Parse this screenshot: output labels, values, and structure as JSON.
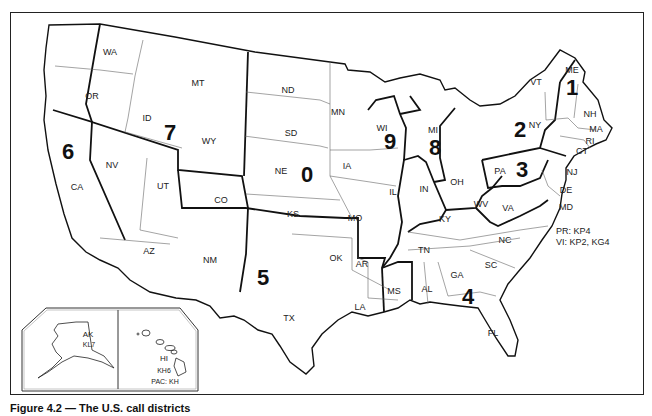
{
  "figure": {
    "caption": "Figure 4.2 — The U.S. call districts",
    "type": "map"
  },
  "districts": [
    {
      "id": "0",
      "label": "0",
      "x": 307,
      "y": 175
    },
    {
      "id": "1",
      "label": "1",
      "x": 572,
      "y": 88
    },
    {
      "id": "2",
      "label": "2",
      "x": 520,
      "y": 130
    },
    {
      "id": "3",
      "label": "3",
      "x": 522,
      "y": 170
    },
    {
      "id": "4",
      "label": "4",
      "x": 468,
      "y": 297
    },
    {
      "id": "5",
      "label": "5",
      "x": 263,
      "y": 278
    },
    {
      "id": "6",
      "label": "6",
      "x": 68,
      "y": 152
    },
    {
      "id": "7",
      "label": "7",
      "x": 170,
      "y": 133
    },
    {
      "id": "8",
      "label": "8",
      "x": 435,
      "y": 148
    },
    {
      "id": "9",
      "label": "9",
      "x": 390,
      "y": 142
    }
  ],
  "states": [
    {
      "abbr": "WA",
      "x": 110,
      "y": 52
    },
    {
      "abbr": "OR",
      "x": 92,
      "y": 96
    },
    {
      "abbr": "CA",
      "x": 77,
      "y": 187
    },
    {
      "abbr": "NV",
      "x": 112,
      "y": 165
    },
    {
      "abbr": "ID",
      "x": 147,
      "y": 118
    },
    {
      "abbr": "MT",
      "x": 198,
      "y": 83
    },
    {
      "abbr": "WY",
      "x": 209,
      "y": 141
    },
    {
      "abbr": "UT",
      "x": 163,
      "y": 186
    },
    {
      "abbr": "CO",
      "x": 221,
      "y": 200
    },
    {
      "abbr": "AZ",
      "x": 149,
      "y": 251
    },
    {
      "abbr": "NM",
      "x": 210,
      "y": 260
    },
    {
      "abbr": "ND",
      "x": 288,
      "y": 90
    },
    {
      "abbr": "SD",
      "x": 291,
      "y": 133
    },
    {
      "abbr": "NE",
      "x": 281,
      "y": 171
    },
    {
      "abbr": "KS",
      "x": 293,
      "y": 214
    },
    {
      "abbr": "OK",
      "x": 336,
      "y": 258
    },
    {
      "abbr": "TX",
      "x": 289,
      "y": 318
    },
    {
      "abbr": "MN",
      "x": 338,
      "y": 112
    },
    {
      "abbr": "IA",
      "x": 347,
      "y": 166
    },
    {
      "abbr": "MO",
      "x": 355,
      "y": 218
    },
    {
      "abbr": "AR",
      "x": 362,
      "y": 264
    },
    {
      "abbr": "LA",
      "x": 360,
      "y": 307
    },
    {
      "abbr": "WI",
      "x": 382,
      "y": 128
    },
    {
      "abbr": "IL",
      "x": 393,
      "y": 192
    },
    {
      "abbr": "MI",
      "x": 433,
      "y": 130
    },
    {
      "abbr": "IN",
      "x": 424,
      "y": 189
    },
    {
      "abbr": "OH",
      "x": 457,
      "y": 182
    },
    {
      "abbr": "KY",
      "x": 445,
      "y": 219
    },
    {
      "abbr": "TN",
      "x": 424,
      "y": 250
    },
    {
      "abbr": "MS",
      "x": 394,
      "y": 291
    },
    {
      "abbr": "AL",
      "x": 427,
      "y": 289
    },
    {
      "abbr": "GA",
      "x": 457,
      "y": 275
    },
    {
      "abbr": "FL",
      "x": 493,
      "y": 333
    },
    {
      "abbr": "SC",
      "x": 491,
      "y": 265
    },
    {
      "abbr": "NC",
      "x": 505,
      "y": 240
    },
    {
      "abbr": "VA",
      "x": 508,
      "y": 208
    },
    {
      "abbr": "WV",
      "x": 481,
      "y": 204
    },
    {
      "abbr": "PA",
      "x": 500,
      "y": 171
    },
    {
      "abbr": "NY",
      "x": 535,
      "y": 125
    },
    {
      "abbr": "VT",
      "x": 536,
      "y": 82
    },
    {
      "abbr": "NH",
      "x": 590,
      "y": 114
    },
    {
      "abbr": "ME",
      "x": 572,
      "y": 70
    },
    {
      "abbr": "MA",
      "x": 596,
      "y": 129
    },
    {
      "abbr": "RI",
      "x": 590,
      "y": 141
    },
    {
      "abbr": "CT",
      "x": 582,
      "y": 151
    },
    {
      "abbr": "NJ",
      "x": 572,
      "y": 172
    },
    {
      "abbr": "DE",
      "x": 566,
      "y": 190
    },
    {
      "abbr": "MD",
      "x": 566,
      "y": 207
    }
  ],
  "territories_note": {
    "line1": "PR: KP4",
    "line2": "VI: KP2, KG4"
  },
  "insets": {
    "alaska": {
      "state": "AK",
      "prefix": "KL7"
    },
    "hawaii": {
      "state": "HI",
      "prefix": "KH6",
      "pacific": "PAC: KH"
    }
  }
}
